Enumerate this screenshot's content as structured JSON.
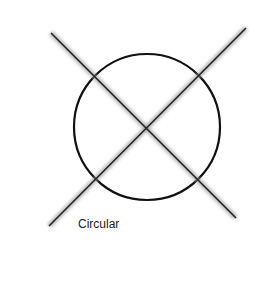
{
  "diagram": {
    "label": "Circular",
    "circle": {
      "cx": 147,
      "cy": 127,
      "r": 73,
      "stroke": "#111111"
    },
    "lines": [
      {
        "x1": 51,
        "y1": 33,
        "x2": 236,
        "y2": 218
      },
      {
        "x1": 49,
        "y1": 226,
        "x2": 246,
        "y2": 28
      }
    ]
  }
}
